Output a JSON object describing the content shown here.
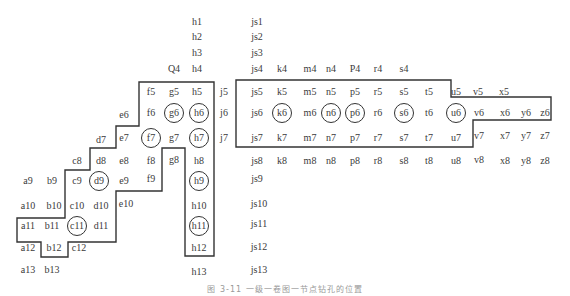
{
  "figure": {
    "caption": "图 3-11  一级一卷图一节点钻孔的位置",
    "line_color": "#333333",
    "text_color": "#3a3a3a"
  },
  "labels": [
    {
      "t": "h1",
      "x": 197,
      "y": 22
    },
    {
      "t": "js1",
      "x": 257,
      "y": 22
    },
    {
      "t": "h2",
      "x": 197,
      "y": 37
    },
    {
      "t": "js2",
      "x": 257,
      "y": 37
    },
    {
      "t": "h3",
      "x": 197,
      "y": 53
    },
    {
      "t": "js3",
      "x": 257,
      "y": 53
    },
    {
      "t": "Q4",
      "x": 174,
      "y": 69
    },
    {
      "t": "h4",
      "x": 197,
      "y": 69
    },
    {
      "t": "js4",
      "x": 257,
      "y": 69
    },
    {
      "t": "k4",
      "x": 282,
      "y": 69
    },
    {
      "t": "m4",
      "x": 310,
      "y": 69
    },
    {
      "t": "n4",
      "x": 331,
      "y": 69
    },
    {
      "t": "P4",
      "x": 355,
      "y": 69
    },
    {
      "t": "r4",
      "x": 378,
      "y": 69
    },
    {
      "t": "s4",
      "x": 404,
      "y": 69
    },
    {
      "t": "f5",
      "x": 151,
      "y": 92
    },
    {
      "t": "g5",
      "x": 174,
      "y": 92
    },
    {
      "t": "h5",
      "x": 197,
      "y": 92
    },
    {
      "t": "j5",
      "x": 224,
      "y": 92
    },
    {
      "t": "js5",
      "x": 257,
      "y": 92
    },
    {
      "t": "k5",
      "x": 282,
      "y": 92
    },
    {
      "t": "m5",
      "x": 310,
      "y": 92
    },
    {
      "t": "n5",
      "x": 331,
      "y": 92
    },
    {
      "t": "p5",
      "x": 355,
      "y": 92
    },
    {
      "t": "r5",
      "x": 378,
      "y": 92
    },
    {
      "t": "s5",
      "x": 404,
      "y": 92
    },
    {
      "t": "t5",
      "x": 429,
      "y": 92
    },
    {
      "t": "u5",
      "x": 456,
      "y": 92
    },
    {
      "t": "v5",
      "x": 478,
      "y": 92
    },
    {
      "t": "x5",
      "x": 504,
      "y": 92
    },
    {
      "t": "e6",
      "x": 124,
      "y": 115
    },
    {
      "t": "f6",
      "x": 151,
      "y": 113
    },
    {
      "t": "g6",
      "x": 174,
      "y": 113
    },
    {
      "t": "h6",
      "x": 199,
      "y": 113
    },
    {
      "t": "j6",
      "x": 224,
      "y": 113
    },
    {
      "t": "js6",
      "x": 257,
      "y": 113
    },
    {
      "t": "k6",
      "x": 282,
      "y": 113
    },
    {
      "t": "m6",
      "x": 310,
      "y": 113
    },
    {
      "t": "n6",
      "x": 331,
      "y": 113
    },
    {
      "t": "p6",
      "x": 355,
      "y": 113
    },
    {
      "t": "r6",
      "x": 378,
      "y": 113
    },
    {
      "t": "s6",
      "x": 404,
      "y": 113
    },
    {
      "t": "t6",
      "x": 429,
      "y": 113
    },
    {
      "t": "u6",
      "x": 456,
      "y": 113
    },
    {
      "t": "v6",
      "x": 479,
      "y": 113
    },
    {
      "t": "x6",
      "x": 505,
      "y": 113
    },
    {
      "t": "y6",
      "x": 526,
      "y": 113
    },
    {
      "t": "z6",
      "x": 545,
      "y": 113
    },
    {
      "t": "d7",
      "x": 101,
      "y": 140
    },
    {
      "t": "e7",
      "x": 124,
      "y": 138
    },
    {
      "t": "f7",
      "x": 151,
      "y": 138
    },
    {
      "t": "g7",
      "x": 174,
      "y": 138
    },
    {
      "t": "h7",
      "x": 199,
      "y": 138
    },
    {
      "t": "j7",
      "x": 224,
      "y": 138
    },
    {
      "t": "js7",
      "x": 257,
      "y": 138
    },
    {
      "t": "k7",
      "x": 282,
      "y": 138
    },
    {
      "t": "m7",
      "x": 310,
      "y": 138
    },
    {
      "t": "n7",
      "x": 331,
      "y": 138
    },
    {
      "t": "p7",
      "x": 355,
      "y": 138
    },
    {
      "t": "r7",
      "x": 378,
      "y": 138
    },
    {
      "t": "s7",
      "x": 404,
      "y": 138
    },
    {
      "t": "t7",
      "x": 429,
      "y": 138
    },
    {
      "t": "u7",
      "x": 456,
      "y": 138
    },
    {
      "t": "v7",
      "x": 479,
      "y": 136
    },
    {
      "t": "x7",
      "x": 505,
      "y": 136
    },
    {
      "t": "y7",
      "x": 526,
      "y": 136
    },
    {
      "t": "z7",
      "x": 545,
      "y": 136
    },
    {
      "t": "c8",
      "x": 77,
      "y": 161
    },
    {
      "t": "d8",
      "x": 101,
      "y": 161
    },
    {
      "t": "e8",
      "x": 124,
      "y": 161
    },
    {
      "t": "f8",
      "x": 151,
      "y": 161
    },
    {
      "t": "g8",
      "x": 174,
      "y": 160
    },
    {
      "t": "h8",
      "x": 199,
      "y": 161
    },
    {
      "t": "js8",
      "x": 257,
      "y": 161
    },
    {
      "t": "k8",
      "x": 282,
      "y": 161
    },
    {
      "t": "m8",
      "x": 310,
      "y": 161
    },
    {
      "t": "n8",
      "x": 331,
      "y": 161
    },
    {
      "t": "p8",
      "x": 355,
      "y": 161
    },
    {
      "t": "r8",
      "x": 378,
      "y": 161
    },
    {
      "t": "s8",
      "x": 404,
      "y": 161
    },
    {
      "t": "t8",
      "x": 429,
      "y": 161
    },
    {
      "t": "u8",
      "x": 456,
      "y": 161
    },
    {
      "t": "v8",
      "x": 479,
      "y": 160
    },
    {
      "t": "x8",
      "x": 505,
      "y": 161
    },
    {
      "t": "y8",
      "x": 526,
      "y": 161
    },
    {
      "t": "z8",
      "x": 545,
      "y": 161
    },
    {
      "t": "a9",
      "x": 28,
      "y": 181
    },
    {
      "t": "b9",
      "x": 52,
      "y": 181
    },
    {
      "t": "c9",
      "x": 77,
      "y": 181
    },
    {
      "t": "d9",
      "x": 99,
      "y": 181
    },
    {
      "t": "e9",
      "x": 124,
      "y": 181
    },
    {
      "t": "f9",
      "x": 151,
      "y": 179
    },
    {
      "t": "h9",
      "x": 199,
      "y": 181
    },
    {
      "t": "js9",
      "x": 257,
      "y": 179
    },
    {
      "t": "a10",
      "x": 28,
      "y": 206
    },
    {
      "t": "b10",
      "x": 54,
      "y": 206
    },
    {
      "t": "c10",
      "x": 77,
      "y": 206
    },
    {
      "t": "d10",
      "x": 101,
      "y": 206
    },
    {
      "t": "e10",
      "x": 126,
      "y": 204
    },
    {
      "t": "h10",
      "x": 199,
      "y": 206
    },
    {
      "t": "js10",
      "x": 259,
      "y": 204
    },
    {
      "t": "a11",
      "x": 28,
      "y": 226
    },
    {
      "t": "b11",
      "x": 52,
      "y": 226
    },
    {
      "t": "c11",
      "x": 77,
      "y": 226
    },
    {
      "t": "d11",
      "x": 101,
      "y": 226
    },
    {
      "t": "h11",
      "x": 199,
      "y": 226
    },
    {
      "t": "js11",
      "x": 259,
      "y": 224
    },
    {
      "t": "a12",
      "x": 28,
      "y": 248
    },
    {
      "t": "b12",
      "x": 54,
      "y": 248
    },
    {
      "t": "c12",
      "x": 79,
      "y": 248
    },
    {
      "t": "h12",
      "x": 199,
      "y": 248
    },
    {
      "t": "js12",
      "x": 259,
      "y": 247
    },
    {
      "t": "a13",
      "x": 28,
      "y": 270
    },
    {
      "t": "b13",
      "x": 52,
      "y": 270
    },
    {
      "t": "h13",
      "x": 199,
      "y": 272
    },
    {
      "t": "js13",
      "x": 259,
      "y": 270
    }
  ],
  "circled": [
    {
      "x": 174,
      "y": 113
    },
    {
      "x": 199,
      "y": 113
    },
    {
      "x": 151,
      "y": 138
    },
    {
      "x": 199,
      "y": 138
    },
    {
      "x": 282,
      "y": 113
    },
    {
      "x": 331,
      "y": 113
    },
    {
      "x": 355,
      "y": 113
    },
    {
      "x": 404,
      "y": 113
    },
    {
      "x": 456,
      "y": 113
    },
    {
      "x": 99,
      "y": 181
    },
    {
      "x": 199,
      "y": 181
    },
    {
      "x": 77,
      "y": 226
    },
    {
      "x": 199,
      "y": 226
    }
  ],
  "boundaries": [
    {
      "name": "left-stair-region",
      "points": "139,82 214,82 214,256 185,256 185,148 162,148 162,191 116,191 116,242 68,242 68,257 41,257 41,242 17,242 17,218 65,218 65,170 90,170 90,148 116,148 116,126 139,126"
    },
    {
      "name": "right-row-region",
      "points": "236,80 451,80 451,97 551,97 551,120 473,120 473,147 236,147"
    }
  ]
}
